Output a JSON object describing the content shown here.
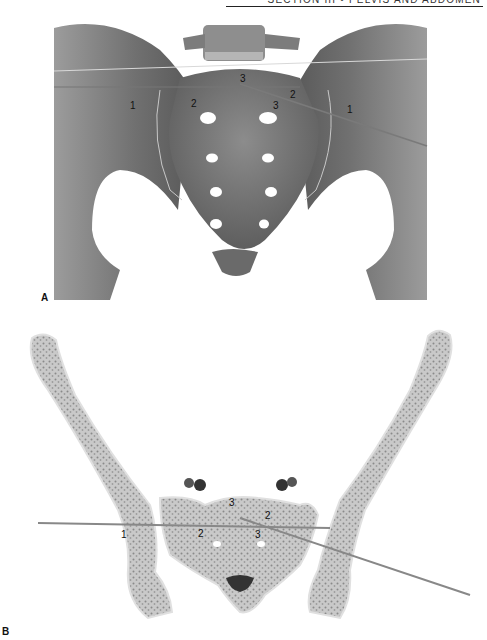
{
  "header": {
    "running_title": "SECTION III  •  PELVIS AND ABDOMEN"
  },
  "figure_a": {
    "panel_label": "A",
    "description": "Anterior view of pelvis showing sacrum and iliac bones with three screw trajectories",
    "trajectory_labels": [
      {
        "id": "a-1-left",
        "text": "1"
      },
      {
        "id": "a-2-left",
        "text": "2"
      },
      {
        "id": "a-3-top",
        "text": "3"
      },
      {
        "id": "a-2-right",
        "text": "2"
      },
      {
        "id": "a-3-right",
        "text": "3"
      },
      {
        "id": "a-1-right",
        "text": "1"
      }
    ]
  },
  "figure_b": {
    "panel_label": "B",
    "description": "Axial cross-section of pelvis at S1 level showing cancellous bone with trajectories",
    "trajectory_labels": [
      {
        "id": "b-1-left",
        "text": "1"
      },
      {
        "id": "b-3-top",
        "text": "3"
      },
      {
        "id": "b-2-right",
        "text": "2"
      },
      {
        "id": "b-2-left",
        "text": "2"
      },
      {
        "id": "b-3-right",
        "text": "3"
      }
    ]
  },
  "colors": {
    "bone_dark": "#6e6e6e",
    "bone_mid": "#9a9a9a",
    "bone_light": "#c8c8c8",
    "section_fill": "#cfcfcf",
    "section_cortex": "#e2e2e2",
    "wire": "#8a8a8a"
  }
}
